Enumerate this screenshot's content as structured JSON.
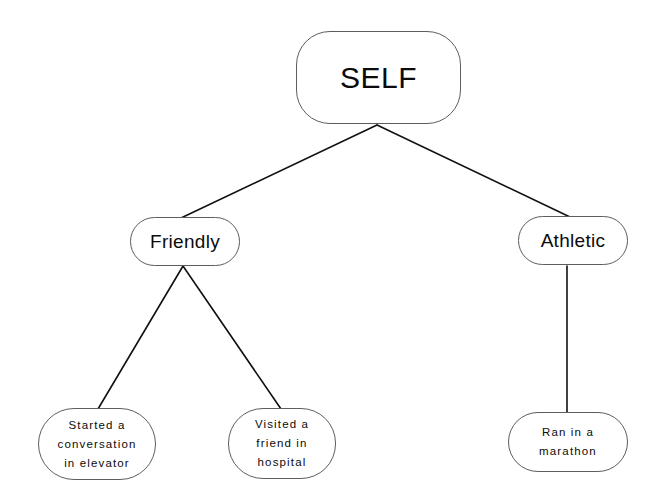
{
  "diagram": {
    "background_color": "#ffffff",
    "node_border_color": "#5d5d5d",
    "edge_color": "#111111",
    "text_color": "#0b0b0b",
    "nodes": {
      "self": {
        "label": "SELF",
        "level": "root"
      },
      "friendly": {
        "label": "Friendly",
        "level": "trait"
      },
      "athletic": {
        "label": "Athletic",
        "level": "trait"
      },
      "started_conversation": {
        "label": "Started a\nconversation\nin elevator",
        "level": "evidence"
      },
      "visited_friend": {
        "label": "Visited a\nfriend in\nhospital",
        "level": "evidence"
      },
      "ran_marathon": {
        "label": "Ran in a\nmarathon",
        "level": "evidence"
      }
    },
    "edges": [
      {
        "from": "self",
        "to": "friendly"
      },
      {
        "from": "self",
        "to": "athletic"
      },
      {
        "from": "friendly",
        "to": "started_conversation"
      },
      {
        "from": "friendly",
        "to": "visited_friend"
      },
      {
        "from": "athletic",
        "to": "ran_marathon"
      }
    ],
    "edge_paths": {
      "self_friendly": "M 377 125 L 181 218",
      "self_athletic": "M 377 125 L 570 217",
      "friendly_started": "M 183 266 L 98 409",
      "friendly_visited": "M 183 266 L 281 409",
      "athletic_ran": "M 567 266 L 567 412"
    }
  }
}
